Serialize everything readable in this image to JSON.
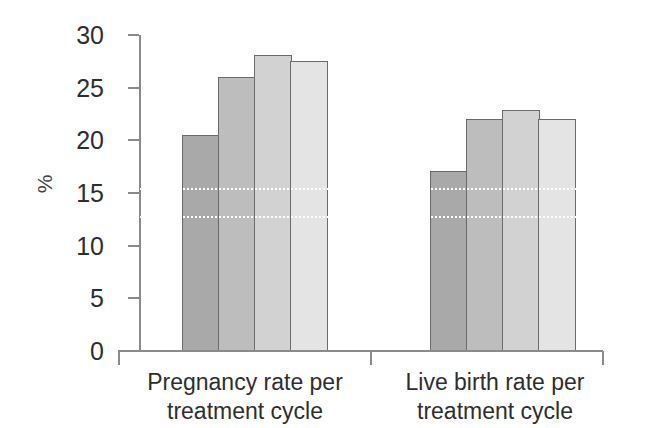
{
  "chart_data": {
    "type": "bar",
    "title": "",
    "subtitle": "",
    "xlabel": "",
    "ylabel": "%",
    "ylim": [
      0,
      30
    ],
    "y_ticks": [
      0,
      5,
      10,
      15,
      20,
      25,
      30
    ],
    "grid": "two white dotted horizontal gridlines drawn over the bars",
    "gridline_values": [
      15.5,
      12.8
    ],
    "legend": "none",
    "legend_position": "none",
    "categories": [
      "Pregnancy rate per treatment cycle",
      "Live birth rate per treatment cycle"
    ],
    "series": [
      {
        "name": "bar-1",
        "color": "#a9a9a9",
        "values": [
          20.5,
          17.1
        ]
      },
      {
        "name": "bar-2",
        "color": "#bdbdbd",
        "values": [
          26.0,
          22.0
        ]
      },
      {
        "name": "bar-3",
        "color": "#d2d2d2",
        "values": [
          28.1,
          22.9
        ]
      },
      {
        "name": "bar-4",
        "color": "#e4e4e4",
        "values": [
          27.5,
          22.0
        ]
      }
    ],
    "bar_outline_color": "#6b6b6b",
    "axis_color": "#8a8a8a"
  },
  "axis": {
    "y_title": "%",
    "tick_labels": [
      "30",
      "25",
      "20",
      "15",
      "10",
      "5",
      "0"
    ]
  },
  "x_labels": [
    {
      "line1": "Pregnancy rate per",
      "line2": "treatment cycle"
    },
    {
      "line1": "Live birth rate per",
      "line2": "treatment cycle"
    }
  ]
}
